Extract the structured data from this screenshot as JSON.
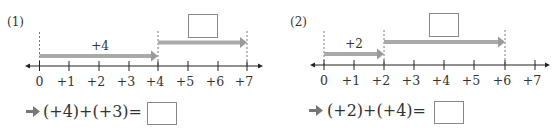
{
  "problems": [
    {
      "label": "(1)",
      "ticks": [
        "0",
        "+1",
        "+2",
        "+3",
        "+4",
        "+5",
        "+6",
        "+7"
      ],
      "first_arrow": {
        "from": 0,
        "to": 4,
        "label": "+4"
      },
      "second_arrow": {
        "from": 4,
        "to": 7,
        "label": ""
      },
      "equation": "(+4)+(+3)=",
      "answer": ""
    },
    {
      "label": "(2)",
      "ticks": [
        "0",
        "+1",
        "+2",
        "+3",
        "+4",
        "+5",
        "+6",
        "+7"
      ],
      "first_arrow": {
        "from": 0,
        "to": 2,
        "label": "+2"
      },
      "second_arrow": {
        "from": 2,
        "to": 6,
        "label": ""
      },
      "equation": "(+2)+(+4)=",
      "answer": ""
    }
  ],
  "colors": {
    "arrow": "#a9a9a9",
    "axis": "#222222",
    "box": "#888888"
  }
}
